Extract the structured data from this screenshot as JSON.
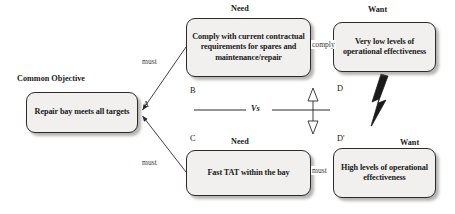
{
  "diagram": {
    "accent_color": "#f1f0ee",
    "border_color": "#2b2b2b",
    "nodes": {
      "a": {
        "tag": "A",
        "caption": "Common Objective",
        "text": "Repair bay meets all targets"
      },
      "b": {
        "tag": "B",
        "caption": "Need",
        "text": "Comply with current contractual requirements for spares and maintenance/repair"
      },
      "c": {
        "tag": "C",
        "caption": "Need",
        "text": "Fast TAT within the bay"
      },
      "d": {
        "tag": "D",
        "caption": "Want",
        "text": "Very low levels of operational effectiveness"
      },
      "dp": {
        "tag": "D'",
        "caption": "Want",
        "text": "High levels of operational effectiveness"
      }
    },
    "edges": {
      "b_to_a": "must",
      "c_to_a": "must",
      "d_to_b": "comply",
      "dp_to_c": "must",
      "conflict": "Vs"
    },
    "symbols": {
      "conflict_arrow": "lightning-bolt-icon",
      "vs_arrow": "double-headed-arrow-icon"
    }
  }
}
